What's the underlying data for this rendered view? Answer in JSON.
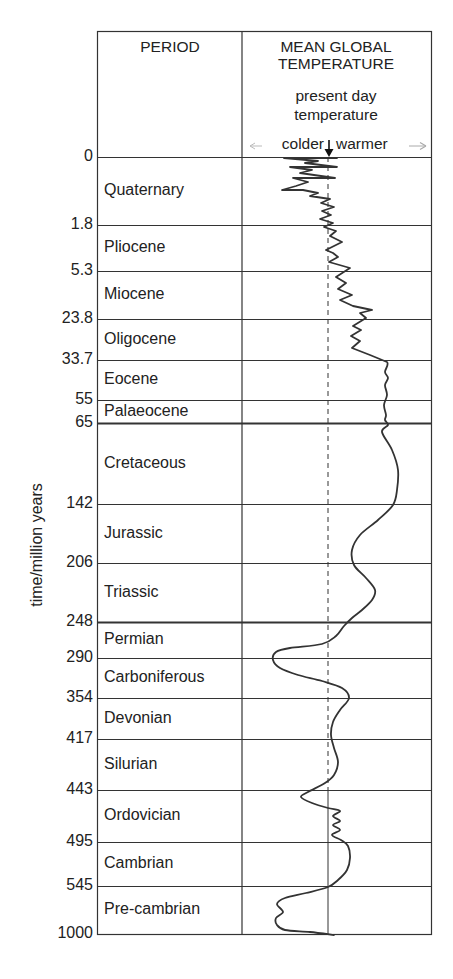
{
  "chart_data": {
    "type": "line",
    "title": "",
    "columns": [
      "PERIOD",
      "MEAN GLOBAL TEMPERATURE"
    ],
    "temperature_header": {
      "line1": "MEAN GLOBAL",
      "line2": "TEMPERATURE",
      "sub1": "present day",
      "sub2": "temperature",
      "colder": "colder",
      "warmer": "warmer"
    },
    "ylabel": "time/million years",
    "xlabel": "relative mean global temperature (colder ← present day → warmer)",
    "grid": true,
    "boundaries": [
      {
        "value": "0",
        "y": 157
      },
      {
        "value": "1.8",
        "y": 225
      },
      {
        "value": "5.3",
        "y": 271
      },
      {
        "value": "23.8",
        "y": 319
      },
      {
        "value": "33.7",
        "y": 360
      },
      {
        "value": "55",
        "y": 400
      },
      {
        "value": "65",
        "y": 423,
        "bold": true
      },
      {
        "value": "142",
        "y": 504
      },
      {
        "value": "206",
        "y": 563
      },
      {
        "value": "248",
        "y": 622,
        "bold": true
      },
      {
        "value": "290",
        "y": 658
      },
      {
        "value": "354",
        "y": 698
      },
      {
        "value": "417",
        "y": 739
      },
      {
        "value": "443",
        "y": 790
      },
      {
        "value": "495",
        "y": 842
      },
      {
        "value": "545",
        "y": 886
      },
      {
        "value": "1000",
        "y": 934
      }
    ],
    "periods": [
      {
        "name": "Quaternary",
        "start_ma": 0,
        "end_ma": 1.8
      },
      {
        "name": "Pliocene",
        "start_ma": 1.8,
        "end_ma": 5.3
      },
      {
        "name": "Miocene",
        "start_ma": 5.3,
        "end_ma": 23.8
      },
      {
        "name": "Oligocene",
        "start_ma": 23.8,
        "end_ma": 33.7
      },
      {
        "name": "Eocene",
        "start_ma": 33.7,
        "end_ma": 55
      },
      {
        "name": "Palaeocene",
        "start_ma": 55,
        "end_ma": 65
      },
      {
        "name": "Cretaceous",
        "start_ma": 65,
        "end_ma": 142
      },
      {
        "name": "Jurassic",
        "start_ma": 142,
        "end_ma": 206
      },
      {
        "name": "Triassic",
        "start_ma": 206,
        "end_ma": 248
      },
      {
        "name": "Permian",
        "start_ma": 248,
        "end_ma": 290
      },
      {
        "name": "Carboniferous",
        "start_ma": 290,
        "end_ma": 354
      },
      {
        "name": "Devonian",
        "start_ma": 354,
        "end_ma": 417
      },
      {
        "name": "Silurian",
        "start_ma": 417,
        "end_ma": 443
      },
      {
        "name": "Ordovician",
        "start_ma": 443,
        "end_ma": 495
      },
      {
        "name": "Cambrian",
        "start_ma": 495,
        "end_ma": 545
      },
      {
        "name": "Pre-cambrian",
        "start_ma": 545,
        "end_ma": 1000
      }
    ],
    "series": [
      {
        "name": "mean global temperature relative to present day",
        "points": [
          [
            337,
            158
          ],
          [
            284,
            158
          ],
          [
            318,
            161
          ],
          [
            305,
            163
          ],
          [
            337,
            167
          ],
          [
            290,
            167
          ],
          [
            312,
            170
          ],
          [
            300,
            173
          ],
          [
            335,
            178
          ],
          [
            293,
            178
          ],
          [
            308,
            182
          ],
          [
            296,
            186
          ],
          [
            282,
            190
          ],
          [
            303,
            190
          ],
          [
            318,
            193
          ],
          [
            310,
            196
          ],
          [
            330,
            199
          ],
          [
            321,
            203
          ],
          [
            334,
            207
          ],
          [
            322,
            211
          ],
          [
            331,
            215
          ],
          [
            320,
            219
          ],
          [
            333,
            223
          ],
          [
            324,
            227
          ],
          [
            336,
            231
          ],
          [
            330,
            236
          ],
          [
            342,
            242
          ],
          [
            326,
            250
          ],
          [
            333,
            253
          ],
          [
            338,
            257
          ],
          [
            329,
            262
          ],
          [
            350,
            268
          ],
          [
            336,
            277
          ],
          [
            346,
            283
          ],
          [
            338,
            289
          ],
          [
            352,
            295
          ],
          [
            340,
            300
          ],
          [
            353,
            306
          ],
          [
            372,
            310
          ],
          [
            360,
            313
          ],
          [
            366,
            318
          ],
          [
            353,
            326
          ],
          [
            361,
            330
          ],
          [
            351,
            336
          ],
          [
            360,
            341
          ],
          [
            352,
            348
          ],
          [
            370,
            355
          ],
          [
            387,
            362
          ],
          [
            385,
            372
          ],
          [
            388,
            378
          ],
          [
            385,
            385
          ],
          [
            387,
            395
          ],
          [
            384,
            405
          ],
          [
            386,
            415
          ],
          [
            385,
            420
          ],
          [
            388,
            425
          ],
          [
            382,
            432
          ],
          [
            392,
            450
          ],
          [
            398,
            470
          ],
          [
            397,
            490
          ],
          [
            393,
            505
          ],
          [
            378,
            520
          ],
          [
            360,
            535
          ],
          [
            352,
            550
          ],
          [
            354,
            565
          ],
          [
            366,
            578
          ],
          [
            375,
            590
          ],
          [
            372,
            600
          ],
          [
            362,
            610
          ],
          [
            352,
            618
          ],
          [
            344,
            626
          ],
          [
            336,
            636
          ],
          [
            322,
            644
          ],
          [
            290,
            648
          ],
          [
            276,
            652
          ],
          [
            273,
            660
          ],
          [
            280,
            668
          ],
          [
            298,
            675
          ],
          [
            322,
            681
          ],
          [
            342,
            688
          ],
          [
            349,
            698
          ],
          [
            340,
            710
          ],
          [
            333,
            722
          ],
          [
            331,
            735
          ],
          [
            334,
            748
          ],
          [
            338,
            762
          ],
          [
            334,
            775
          ],
          [
            325,
            783
          ],
          [
            308,
            792
          ],
          [
            301,
            797
          ],
          [
            312,
            803
          ],
          [
            328,
            808
          ],
          [
            340,
            811
          ],
          [
            333,
            816
          ],
          [
            340,
            821
          ],
          [
            333,
            825
          ],
          [
            340,
            830
          ],
          [
            332,
            835
          ],
          [
            341,
            840
          ],
          [
            348,
            846
          ],
          [
            350,
            858
          ],
          [
            347,
            870
          ],
          [
            338,
            880
          ],
          [
            328,
            887
          ],
          [
            306,
            893
          ],
          [
            285,
            898
          ],
          [
            277,
            904
          ],
          [
            283,
            912
          ],
          [
            276,
            918
          ],
          [
            277,
            925
          ],
          [
            285,
            930
          ],
          [
            310,
            932
          ],
          [
            334,
            935
          ]
        ]
      }
    ],
    "present_day_x": 328,
    "present_day_dashed_until_ma": 443
  }
}
